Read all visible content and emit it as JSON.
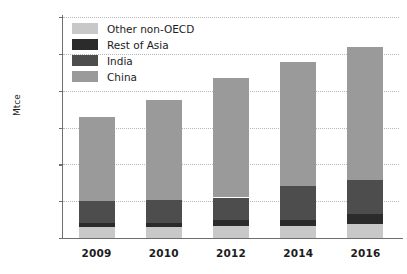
{
  "chart_data": {
    "type": "bar",
    "subtype": "stacked-bar",
    "title": "",
    "xlabel": "",
    "ylabel": "Mtce",
    "categories": [
      "2009",
      "2010",
      "2012",
      "2014",
      "2016"
    ],
    "ylim": [
      0,
      3000
    ],
    "yticks": [
      0,
      500,
      1000,
      1500,
      2000,
      2500,
      3000
    ],
    "ytick_labels": [
      "0",
      "500",
      "1000",
      "1500",
      "2000",
      "2500",
      "3000"
    ],
    "grid": true,
    "grid_axis": "y",
    "legend_position": "upper-left-inside",
    "stack_order_bottom_to_top": [
      "Other non-OECD",
      "Rest of Asia",
      "India",
      "China"
    ],
    "series": [
      {
        "name": "Other non-OECD",
        "color": "#c8c8c8",
        "values": [
          150,
          150,
          165,
          165,
          190
        ]
      },
      {
        "name": "Rest of Asia",
        "color": "#2b2b2b",
        "values": [
          55,
          60,
          75,
          80,
          130
        ]
      },
      {
        "name": "India",
        "color": "#4d4d4d",
        "values": [
          295,
          310,
          310,
          465,
          465
        ]
      },
      {
        "name": "China",
        "color": "#9a9a9a",
        "values": [
          1140,
          1350,
          1620,
          1680,
          1805
        ]
      }
    ],
    "totals": [
      1640,
      1870,
      2170,
      2390,
      2590
    ]
  },
  "legend": {
    "items": [
      {
        "label": "Other non-OECD",
        "color": "#c8c8c8"
      },
      {
        "label": "Rest of Asia",
        "color": "#2b2b2b"
      },
      {
        "label": "India",
        "color": "#4d4d4d"
      },
      {
        "label": "China",
        "color": "#9a9a9a"
      }
    ]
  },
  "axis": {
    "y_title": "Mtce"
  },
  "colors": {
    "axis": "#6f6f6f",
    "gridline": "#b9b9b9",
    "text": "#1c1c1c",
    "background": "#ffffff"
  }
}
